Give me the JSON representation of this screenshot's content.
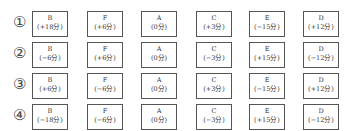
{
  "rows": [
    {
      "label": "①",
      "cells": [
        {
          "letter": "B",
          "value": "(+18分)"
        },
        {
          "letter": "F",
          "value": "(+6分)"
        },
        {
          "letter": "A",
          "value": "(0分)"
        },
        {
          "letter": "C",
          "value": "(+3分)"
        },
        {
          "letter": "E",
          "value": "(−15分)"
        },
        {
          "letter": "D",
          "value": "(+12分)"
        }
      ]
    },
    {
      "label": "②",
      "cells": [
        {
          "letter": "B",
          "value": "(−6分)"
        },
        {
          "letter": "F",
          "value": "(+6分)"
        },
        {
          "letter": "A",
          "value": "(0分)"
        },
        {
          "letter": "C",
          "value": "(−3分)"
        },
        {
          "letter": "E",
          "value": "(+15分)"
        },
        {
          "letter": "D",
          "value": "(−12分)"
        }
      ]
    },
    {
      "label": "③",
      "cells": [
        {
          "letter": "B",
          "value": "(+6分)"
        },
        {
          "letter": "F",
          "value": "(−6分)"
        },
        {
          "letter": "A",
          "value": "(0分)"
        },
        {
          "letter": "C",
          "value": "(+3分)"
        },
        {
          "letter": "E",
          "value": "(−15分)"
        },
        {
          "letter": "D",
          "value": "(+12分)"
        }
      ]
    },
    {
      "label": "④",
      "cells": [
        {
          "letter": "B",
          "value": "(−18分)"
        },
        {
          "letter": "F",
          "value": "(−6分)"
        },
        {
          "letter": "A",
          "value": "(0分)"
        },
        {
          "letter": "C",
          "value": "(−3分)"
        },
        {
          "letter": "E",
          "value": "(+15分)"
        },
        {
          "letter": "D",
          "value": "(−12分)"
        }
      ]
    }
  ]
}
